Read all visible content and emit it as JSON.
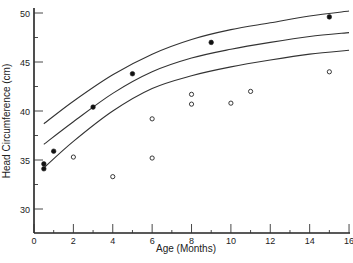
{
  "chart_data": {
    "type": "scatter",
    "title": "",
    "xlabel": "Age  (Months)",
    "ylabel": "Head Circumference  (cm)",
    "xlim": [
      0,
      16
    ],
    "ylim": [
      27.5,
      50
    ],
    "x_ticks": [
      0,
      2,
      4,
      6,
      8,
      10,
      12,
      14,
      16
    ],
    "y_ticks": [
      30,
      35,
      40,
      45,
      50
    ],
    "grid": false,
    "legend": null,
    "series": [
      {
        "name": "filled points",
        "marker": "filled-circle",
        "points": [
          [
            0.5,
            34.6
          ],
          [
            0.5,
            34.1
          ],
          [
            1,
            35.9
          ],
          [
            3,
            40.4
          ],
          [
            5,
            43.8
          ],
          [
            9,
            47.0
          ],
          [
            15,
            49.6
          ]
        ]
      },
      {
        "name": "open points",
        "marker": "open-circle",
        "points": [
          [
            2,
            35.3
          ],
          [
            4,
            33.3
          ],
          [
            6,
            39.2
          ],
          [
            6,
            35.2
          ],
          [
            8,
            41.7
          ],
          [
            8,
            40.7
          ],
          [
            10,
            40.8
          ],
          [
            11,
            42.0
          ],
          [
            15,
            44.0
          ]
        ]
      }
    ],
    "curves": [
      {
        "name": "upper reference curve",
        "x": [
          0.5,
          2,
          4,
          6,
          8,
          10,
          12,
          14,
          16
        ],
        "y": [
          38.7,
          41.0,
          43.7,
          45.8,
          47.3,
          48.3,
          49.0,
          49.7,
          50.2
        ]
      },
      {
        "name": "middle reference curve",
        "x": [
          0.5,
          2,
          4,
          6,
          8,
          10,
          12,
          14,
          16
        ],
        "y": [
          36.6,
          38.9,
          41.8,
          44.0,
          45.4,
          46.3,
          47.0,
          47.6,
          48.0
        ]
      },
      {
        "name": "lower reference curve",
        "x": [
          0.5,
          2,
          4,
          6,
          8,
          10,
          12,
          14,
          16
        ],
        "y": [
          34.2,
          36.9,
          40.0,
          42.3,
          43.6,
          44.5,
          45.2,
          45.8,
          46.2
        ]
      }
    ]
  }
}
